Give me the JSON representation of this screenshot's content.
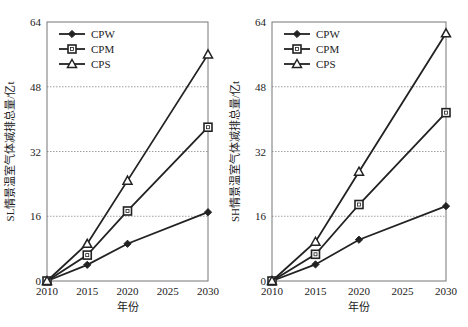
{
  "chart_data": [
    {
      "type": "line",
      "title": "",
      "xlabel": "年份",
      "ylabel": "SL情景温室气体减排总量/亿t",
      "x": [
        2010,
        2015,
        2020,
        2030
      ],
      "xticks": [
        "2010",
        "2015",
        "2020",
        "2025",
        "2030"
      ],
      "yticks": [
        "0",
        "16",
        "32",
        "48",
        "64"
      ],
      "ylim": [
        0,
        64
      ],
      "xlim": [
        2010,
        2030
      ],
      "grid": "horizontal dotted",
      "legend_position": "upper-left",
      "series": [
        {
          "name": "CPW",
          "marker": "diamond",
          "values": [
            0,
            4,
            9.2,
            17
          ]
        },
        {
          "name": "CPM",
          "marker": "square",
          "values": [
            0,
            6.4,
            17.3,
            38
          ]
        },
        {
          "name": "CPS",
          "marker": "triangle",
          "values": [
            0,
            9.2,
            24.8,
            56
          ]
        }
      ]
    },
    {
      "type": "line",
      "title": "",
      "xlabel": "年份",
      "ylabel": "SH情景温室气体减排总量/亿t",
      "x": [
        2010,
        2015,
        2020,
        2030
      ],
      "xticks": [
        "2010",
        "2015",
        "2020",
        "2025",
        "2030"
      ],
      "yticks": [
        "0",
        "16",
        "32",
        "48",
        "64"
      ],
      "ylim": [
        0,
        64
      ],
      "xlim": [
        2010,
        2030
      ],
      "grid": "horizontal dotted",
      "legend_position": "upper-left",
      "series": [
        {
          "name": "CPW",
          "marker": "diamond",
          "values": [
            0,
            4.1,
            10.2,
            18.5
          ]
        },
        {
          "name": "CPM",
          "marker": "square",
          "values": [
            0,
            6.6,
            18.9,
            41.6
          ]
        },
        {
          "name": "CPS",
          "marker": "triangle",
          "values": [
            0,
            9.7,
            27,
            61.2
          ]
        }
      ]
    }
  ]
}
